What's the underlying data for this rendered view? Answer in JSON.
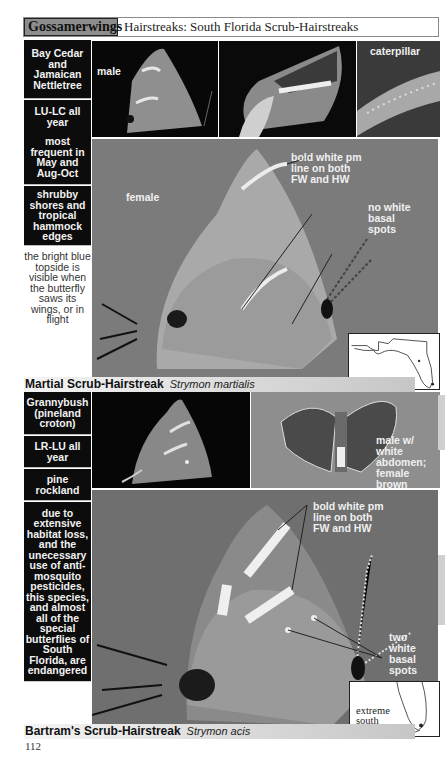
{
  "header": {
    "section_tag": "Gossamerwings",
    "title": "Hairstreaks: South Florida Scrub-Hairstreaks"
  },
  "species": [
    {
      "common_name": "Martial Scrub-Hairstreak",
      "scientific_name": "Strymon martialis",
      "sidebar": [
        {
          "text": [
            "Bay Cedar and Jamaican Nettletree"
          ],
          "style": "dark"
        },
        {
          "text": [
            "LU-LC all year",
            "most frequent in May and Aug-Oct"
          ],
          "style": "dark"
        },
        {
          "text": [
            "shrubby shores and tropical hammock edges"
          ],
          "style": "dark"
        },
        {
          "text": [
            "the bright blue topside is visible when the butterfly saws its wings, or in flight"
          ],
          "style": "light"
        }
      ],
      "photos": {
        "thumb1_label": "male",
        "thumb2_label": "",
        "thumb3_label": "caterpillar",
        "main_labels": {
          "sex": "female",
          "annotation1": "bold white pm\nline on both\nFW and HW",
          "annotation2": "no white\nbasal\nspots"
        }
      },
      "map": {
        "label": ""
      }
    },
    {
      "common_name": "Bartram's Scrub-Hairstreak",
      "scientific_name": "Strymon acis",
      "sidebar": [
        {
          "text": [
            "Grannybush (pineland croton)"
          ],
          "style": "dark"
        },
        {
          "text": [
            "LR-LU all year"
          ],
          "style": "dark"
        },
        {
          "text": [
            "pine rockland"
          ],
          "style": "dark"
        },
        {
          "text": [
            "due to extensive habitat loss, and the unecessary use of anti-mosquito pesticides, this species, and almost all of the special butterflies of South Florida, are endangered"
          ],
          "style": "dark"
        }
      ],
      "photos": {
        "thumb1_label": "",
        "thumb2_label": "male w/\nwhite\nabdomen;\nfemale\nbrown",
        "main_labels": {
          "annotation1": "bold white pm\nline on both\nFW and HW",
          "annotation2": "two\nwhite\nbasal\nspots"
        }
      },
      "map": {
        "label": "extreme\nsouth\nFlorida"
      }
    }
  ],
  "page_number": "112"
}
